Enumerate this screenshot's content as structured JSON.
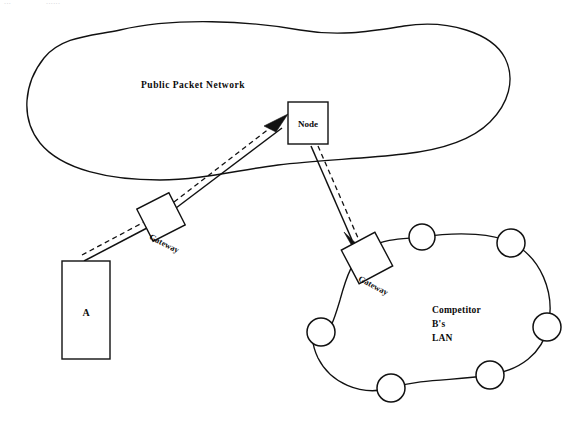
{
  "page": {
    "width": 577,
    "height": 428,
    "background": "#ffffff",
    "ink_color": "#111111",
    "header_left": "···",
    "header_right": "······"
  },
  "diagram": {
    "type": "network-topology",
    "cloud": {
      "label": "Public Packet Network",
      "label_x": 193,
      "label_y": 88
    },
    "nodes": [
      {
        "id": "terminal-a",
        "label": "A",
        "shape": "rectangle",
        "x": 62,
        "y": 261,
        "width": 48,
        "height": 98,
        "label_x": 86,
        "label_y": 313
      },
      {
        "id": "gateway-a",
        "label": "Gateway",
        "shape": "rotated-square",
        "center_x": 161,
        "center_y": 217,
        "size": 36,
        "rotation": -27,
        "label_x": 180,
        "label_y": 243,
        "label_rotation": -27
      },
      {
        "id": "packet-node",
        "label": "Node",
        "shape": "rectangle",
        "x": 288,
        "y": 102,
        "width": 40,
        "height": 42,
        "label_x": 308,
        "label_y": 126
      },
      {
        "id": "gateway-b",
        "label": "Gateway",
        "shape": "rotated-square",
        "center_x": 367,
        "center_y": 258,
        "size": 38,
        "rotation": -28,
        "label_x": 387,
        "label_y": 284,
        "label_rotation": -28
      }
    ],
    "links": [
      {
        "id": "link-a-to-gateway",
        "from": "terminal-a",
        "to": "gateway-a",
        "style": "solid-plus-dashed",
        "arrow": "none"
      },
      {
        "id": "link-gateway-to-node",
        "from": "gateway-a",
        "to": "packet-node",
        "style": "solid-plus-dashed",
        "arrow": "to-node"
      },
      {
        "id": "link-node-to-gateway-b",
        "from": "packet-node",
        "to": "gateway-b",
        "style": "solid-plus-dashed",
        "arrow": "to-gateway-b"
      }
    ],
    "lan": {
      "label_lines": [
        "Competitor",
        "B's",
        "LAN"
      ],
      "label_x": 432,
      "label_y": 313,
      "station_count": 6,
      "stations": [
        {
          "id": "lan-station-1",
          "cx": 422,
          "cy": 237,
          "r": 13
        },
        {
          "id": "lan-station-2",
          "cx": 511,
          "cy": 243,
          "r": 14
        },
        {
          "id": "lan-station-3",
          "cx": 547,
          "cy": 327,
          "r": 14
        },
        {
          "id": "lan-station-4",
          "cx": 490,
          "cy": 375,
          "r": 14
        },
        {
          "id": "lan-station-5",
          "cx": 391,
          "cy": 388,
          "r": 14
        },
        {
          "id": "lan-station-6",
          "cx": 321,
          "cy": 332,
          "r": 14
        }
      ]
    }
  }
}
